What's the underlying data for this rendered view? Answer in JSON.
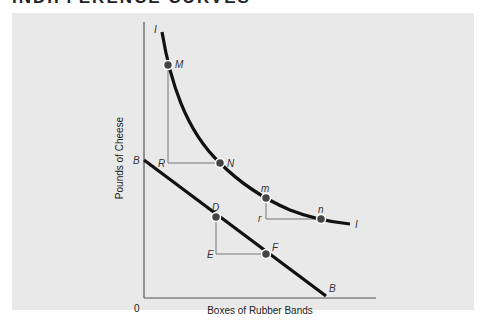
{
  "heading": "INDIFFERENCE CURVES",
  "diagram": {
    "x_axis_label": "Boxes of Rubber Bands",
    "y_axis_label": "Pounds of Cheese",
    "origin_label": "0",
    "indifference_curve": {
      "label_top": "I",
      "label_end": "I"
    },
    "budget_line": {
      "label_top": "B",
      "label_end": "B"
    },
    "points": {
      "M": "M",
      "N": "N",
      "R": "R",
      "m": "m",
      "n": "n",
      "r": "r",
      "D": "D",
      "E": "E",
      "F": "F"
    },
    "colors": {
      "panel_bg": "#e9e9e9",
      "curve": "#111111",
      "guide": "#777777",
      "point": "#444444"
    }
  }
}
